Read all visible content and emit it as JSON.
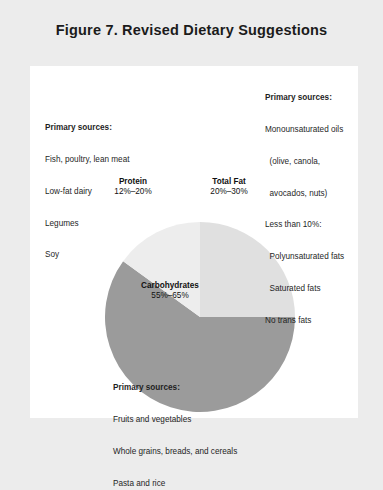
{
  "figure": {
    "title": "Figure 7. Revised Dietary Suggestions"
  },
  "chart_data": {
    "type": "pie",
    "title": "Figure 7. Revised Dietary Suggestions",
    "categories": [
      "Total Fat",
      "Carbohydrates",
      "Protein"
    ],
    "values": [
      25,
      60,
      15
    ],
    "value_labels": [
      "20%–30%",
      "55%–65%",
      "12%–20%"
    ],
    "colors": [
      "#e0e0e0",
      "#9b9b9b",
      "#ededed"
    ],
    "legend": "none",
    "grid": false,
    "start_angle_deg": 0,
    "direction": "clockwise",
    "slices": [
      {
        "name": "Total Fat",
        "value_label": "20%–30%",
        "percent": 25,
        "color": "#e0e0e0",
        "sources_heading": "Primary sources:",
        "sources": [
          "Monounsaturated oils",
          "(olive, canola,",
          "avocados, nuts)",
          "Less than 10%:",
          "Polyunsaturated fats",
          "Saturated fats",
          "No trans fats"
        ]
      },
      {
        "name": "Protein",
        "value_label": "12%–20%",
        "percent": 15,
        "color": "#ededed",
        "sources_heading": "Primary sources:",
        "sources": [
          "Fish, poultry, lean meat",
          "Low-fat dairy",
          "Legumes",
          "Soy"
        ]
      },
      {
        "name": "Carbohydrates",
        "value_label": "55%–65%",
        "percent": 60,
        "color": "#9b9b9b",
        "sources_heading": "Primary sources:",
        "sources": [
          "Fruits and vegetables",
          "Whole grains, breads, and cereals",
          "Pasta and rice"
        ]
      }
    ]
  },
  "annotations": {
    "fat": {
      "heading": "Primary sources:",
      "lines": [
        "Monounsaturated oils",
        "  (olive, canola,",
        "  avocados, nuts)",
        "Less than 10%:",
        "  Polyunsaturated fats",
        "  Saturated fats",
        "No trans fats"
      ]
    },
    "protein": {
      "heading": "Primary sources:",
      "lines": [
        "Fish, poultry, lean meat",
        "Low-fat dairy",
        "Legumes",
        "Soy"
      ]
    },
    "carbs": {
      "heading": "Primary sources:",
      "lines": [
        "Fruits and vegetables",
        "Whole grains, breads, and cereals",
        "Pasta and rice"
      ]
    }
  }
}
